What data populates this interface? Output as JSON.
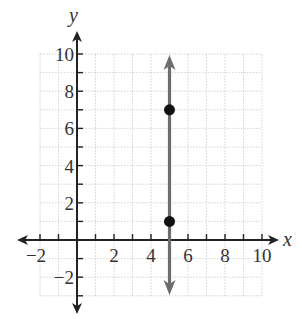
{
  "chart_data": {
    "type": "line",
    "title": "",
    "xlabel": "x",
    "ylabel": "y",
    "xlim": [
      -2,
      10
    ],
    "ylim": [
      -3,
      10
    ],
    "grid": true,
    "x_ticks": [
      -2,
      2,
      4,
      6,
      8,
      10
    ],
    "y_ticks": [
      -2,
      2,
      4,
      6,
      8,
      10
    ],
    "x_tick_labels": [
      "−2",
      "2",
      "4",
      "6",
      "8",
      "10"
    ],
    "y_tick_labels": [
      "−2",
      "2",
      "4",
      "6",
      "8",
      "10"
    ],
    "series": [
      {
        "name": "vertical line x = 5",
        "kind": "line",
        "equation": "x = 5",
        "x": [
          5,
          5
        ],
        "y": [
          -3,
          10
        ],
        "arrows": "both",
        "color": "#6d6d6d"
      },
      {
        "name": "points",
        "kind": "scatter",
        "points": [
          {
            "x": 5,
            "y": 7
          },
          {
            "x": 5,
            "y": 1
          }
        ],
        "color": "#111111"
      }
    ]
  },
  "axes": {
    "x_name": "x",
    "y_name": "y"
  },
  "colors": {
    "axis": "#222222",
    "grid": "#c8c8c8",
    "line": "#6d6d6d",
    "point": "#111111"
  }
}
